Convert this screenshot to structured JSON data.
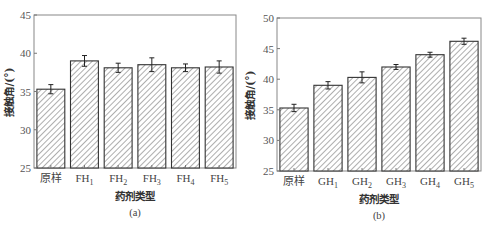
{
  "chart_data": [
    {
      "type": "bar",
      "panel_label": "(a)",
      "title": "",
      "xlabel": "药剂类型",
      "ylabel": "接触角/(°)",
      "ylim": [
        25,
        45
      ],
      "yticks": [
        25,
        30,
        35,
        40,
        45
      ],
      "grid": false,
      "hatch": "diagonal",
      "categories": [
        {
          "base": "原样",
          "sub": ""
        },
        {
          "base": "FH",
          "sub": "1"
        },
        {
          "base": "FH",
          "sub": "2"
        },
        {
          "base": "FH",
          "sub": "3"
        },
        {
          "base": "FH",
          "sub": "4"
        },
        {
          "base": "FH",
          "sub": "5"
        }
      ],
      "values": [
        35.3,
        39.0,
        38.1,
        38.5,
        38.1,
        38.2
      ],
      "errors": [
        0.6,
        0.7,
        0.6,
        0.9,
        0.5,
        0.8
      ]
    },
    {
      "type": "bar",
      "panel_label": "(b)",
      "title": "",
      "xlabel": "药剂类型",
      "ylabel": "接触角/(°)",
      "ylim": [
        25,
        50
      ],
      "yticks": [
        25,
        30,
        35,
        40,
        45,
        50
      ],
      "grid": false,
      "hatch": "diagonal",
      "categories": [
        {
          "base": "原样",
          "sub": ""
        },
        {
          "base": "GH",
          "sub": "1"
        },
        {
          "base": "GH",
          "sub": "2"
        },
        {
          "base": "GH",
          "sub": "3"
        },
        {
          "base": "GH",
          "sub": "4"
        },
        {
          "base": "GH",
          "sub": "5"
        }
      ],
      "values": [
        35.3,
        39.0,
        40.3,
        42.0,
        44.0,
        46.2
      ],
      "errors": [
        0.6,
        0.6,
        0.9,
        0.4,
        0.4,
        0.5
      ]
    }
  ]
}
